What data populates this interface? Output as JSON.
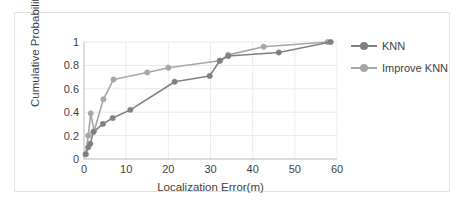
{
  "chart_data": {
    "type": "line",
    "title": "",
    "xlabel": "Localization Error(m)",
    "ylabel": "Cumulative Probability",
    "xlim": [
      0,
      60
    ],
    "ylim": [
      0,
      1
    ],
    "xticks": [
      0,
      10,
      20,
      30,
      40,
      50,
      60
    ],
    "yticks": [
      0,
      0.2,
      0.4,
      0.6,
      0.8,
      1
    ],
    "xtick_labels": [
      "0",
      "10",
      "20",
      "30",
      "40",
      "50",
      "60"
    ],
    "ytick_labels": [
      "0",
      "0.2",
      "0.4",
      "0.6",
      "0.8",
      "1"
    ],
    "grid": "horizontal-and-vertical-light",
    "legend_position": "right",
    "markers": "circle",
    "series": [
      {
        "name": "KNN",
        "color": "#808080",
        "points": [
          {
            "x": 0.4,
            "y": 0.04
          },
          {
            "x": 1.0,
            "y": 0.1
          },
          {
            "x": 1.5,
            "y": 0.13
          },
          {
            "x": 2.2,
            "y": 0.23
          },
          {
            "x": 4.5,
            "y": 0.3
          },
          {
            "x": 6.8,
            "y": 0.35
          },
          {
            "x": 11.0,
            "y": 0.42
          },
          {
            "x": 21.5,
            "y": 0.66
          },
          {
            "x": 29.8,
            "y": 0.71
          },
          {
            "x": 32.2,
            "y": 0.84
          },
          {
            "x": 34.2,
            "y": 0.88
          },
          {
            "x": 46.2,
            "y": 0.91
          },
          {
            "x": 58.5,
            "y": 1.0
          }
        ]
      },
      {
        "name": "Improve KNN",
        "color": "#a6a6a6",
        "points": [
          {
            "x": 0.4,
            "y": 0.04
          },
          {
            "x": 1.0,
            "y": 0.2
          },
          {
            "x": 1.6,
            "y": 0.39
          },
          {
            "x": 2.4,
            "y": 0.24
          },
          {
            "x": 4.6,
            "y": 0.51
          },
          {
            "x": 7.0,
            "y": 0.68
          },
          {
            "x": 15.0,
            "y": 0.74
          },
          {
            "x": 20.0,
            "y": 0.78
          },
          {
            "x": 32.2,
            "y": 0.84
          },
          {
            "x": 34.2,
            "y": 0.89
          },
          {
            "x": 42.6,
            "y": 0.96
          },
          {
            "x": 57.8,
            "y": 1.0
          }
        ]
      }
    ]
  },
  "legend": {
    "items": [
      {
        "label": "KNN"
      },
      {
        "label": "Improve KNN"
      }
    ]
  },
  "axes": {
    "x_title": "Localization Error(m)",
    "y_title": "Cumulative Probability"
  },
  "caption": {
    "text": ""
  }
}
